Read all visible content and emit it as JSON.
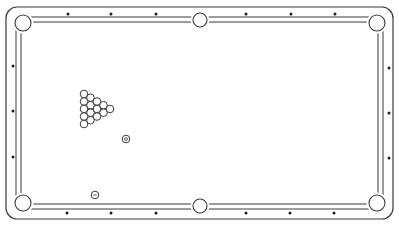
{
  "scene": {
    "title": "Pool table top view",
    "background": "#ffffff",
    "line_color": "#3a3a3a",
    "diamond_color": "#1e1e1e"
  },
  "table": {
    "outer_frame": {
      "x": 6,
      "y": 7,
      "w": 387,
      "h": 212,
      "r": 11
    },
    "rail_inner": {
      "x": 16,
      "y": 17,
      "w": 367,
      "h": 192
    },
    "cushion_inner": {
      "x": 21,
      "y": 22,
      "w": 357,
      "h": 182
    }
  },
  "pockets": [
    {
      "name": "top-left",
      "cx": 23,
      "cy": 23,
      "r": 8
    },
    {
      "name": "top-side",
      "cx": 200,
      "cy": 20,
      "r": 7
    },
    {
      "name": "top-right",
      "cx": 377,
      "cy": 23,
      "r": 8
    },
    {
      "name": "bottom-left",
      "cx": 23,
      "cy": 203,
      "r": 8
    },
    {
      "name": "bottom-side",
      "cx": 200,
      "cy": 206,
      "r": 7
    },
    {
      "name": "bottom-right",
      "cx": 377,
      "cy": 203,
      "r": 8
    }
  ],
  "diamonds": {
    "top": [
      [
        68,
        14
      ],
      [
        111,
        14
      ],
      [
        156,
        14
      ],
      [
        246,
        14
      ],
      [
        291,
        14
      ],
      [
        335,
        14
      ]
    ],
    "bottom": [
      [
        67,
        213
      ],
      [
        111,
        213
      ],
      [
        156,
        213
      ],
      [
        246,
        213
      ],
      [
        290,
        213
      ],
      [
        334,
        213
      ]
    ],
    "left": [
      [
        13,
        66
      ],
      [
        13,
        111
      ],
      [
        13,
        157
      ]
    ],
    "right": [
      [
        389,
        68
      ],
      [
        389,
        113
      ],
      [
        389,
        158
      ]
    ]
  },
  "rack": {
    "ball_radius": 3.8,
    "balls": [
      [
        84,
        94
      ],
      [
        84,
        101.5
      ],
      [
        84,
        109
      ],
      [
        84,
        116.5
      ],
      [
        84,
        124
      ],
      [
        90.5,
        97.7
      ],
      [
        90.5,
        105.2
      ],
      [
        90.5,
        112.7
      ],
      [
        90.5,
        120.2
      ],
      [
        97,
        101.5
      ],
      [
        97,
        109
      ],
      [
        97,
        116.5
      ],
      [
        103.5,
        105.2
      ],
      [
        103.5,
        112.7
      ],
      [
        110,
        109
      ]
    ]
  },
  "cue_ball": {
    "cx": 126,
    "cy": 139,
    "r": 3.8,
    "marker": "dot"
  },
  "object_ball": {
    "cx": 95,
    "cy": 195,
    "r": 3.8,
    "marker": "dash"
  }
}
